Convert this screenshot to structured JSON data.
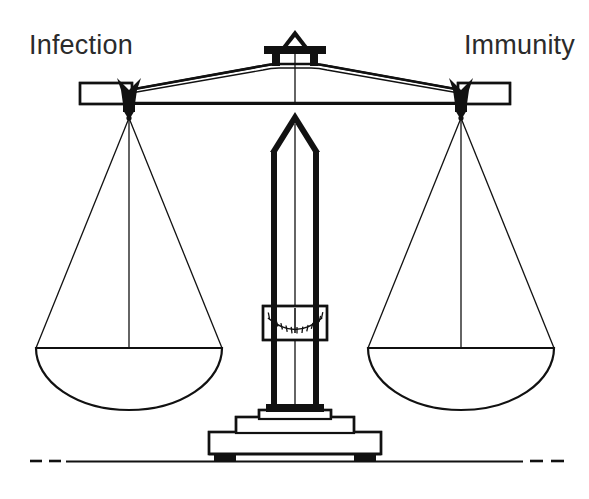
{
  "figure": {
    "kind": "balance-scale-diagram",
    "title_left": "Infection",
    "title_right": "Immunity",
    "ink_color": "#111111",
    "background_color": "#ffffff",
    "text_color": "#2b2b2b",
    "state": "balanced",
    "labels": {
      "left": "Infection",
      "right": "Immunity"
    },
    "parts": {
      "beam": "beam",
      "pivot": "pivot-finial",
      "left_pan": "left-pan",
      "right_pan": "right-pan",
      "column": "center-column",
      "gauge": "gauge-dial",
      "base": "pedestal-base",
      "ground": "ground-line"
    },
    "gauge": {
      "tick_count": 13,
      "needle_position": "center"
    }
  }
}
